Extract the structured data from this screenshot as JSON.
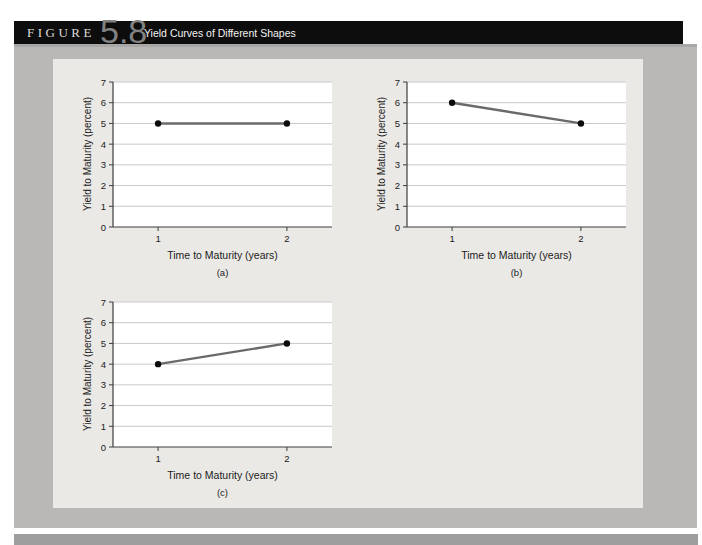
{
  "header": {
    "figure_label": "FIGURE",
    "figure_number": "5.8",
    "figure_title": "Yield Curves of Different Shapes"
  },
  "colors": {
    "header_bar": "#0d0d0d",
    "outer_panel": "#b9b8b6",
    "inner_panel": "#eae9e5",
    "plot_bg": "#ffffff",
    "gridline": "#c9c9c9",
    "axis": "#3c3c3c",
    "line": "#6a6a6a",
    "point": "#0c0c0c",
    "tick_text": "#1c1c1c",
    "bottom_bar": "#9e9e9e"
  },
  "chart_data": [
    {
      "type": "line",
      "caption": "(a)",
      "x": [
        1,
        2
      ],
      "y": [
        5,
        5
      ],
      "xlabel": "Time to Maturity (years)",
      "ylabel": "Yield to Maturity (percent)",
      "xticks": [
        1,
        2
      ],
      "yticks": [
        0,
        1,
        2,
        3,
        4,
        5,
        6,
        7
      ],
      "xlim": [
        0.65,
        2.35
      ],
      "ylim": [
        0,
        7
      ],
      "grid": "horizontal",
      "legend": "none"
    },
    {
      "type": "line",
      "caption": "(b)",
      "x": [
        1,
        2
      ],
      "y": [
        6,
        5
      ],
      "xlabel": "Time to Maturity (years)",
      "ylabel": "Yield to Maturity (percent)",
      "xticks": [
        1,
        2
      ],
      "yticks": [
        0,
        1,
        2,
        3,
        4,
        5,
        6,
        7
      ],
      "xlim": [
        0.65,
        2.35
      ],
      "ylim": [
        0,
        7
      ],
      "grid": "horizontal",
      "legend": "none"
    },
    {
      "type": "line",
      "caption": "(c)",
      "x": [
        1,
        2
      ],
      "y": [
        4,
        5
      ],
      "xlabel": "Time to Maturity (years)",
      "ylabel": "Yield to Maturity (percent)",
      "xticks": [
        1,
        2
      ],
      "yticks": [
        0,
        1,
        2,
        3,
        4,
        5,
        6,
        7
      ],
      "xlim": [
        0.65,
        2.35
      ],
      "ylim": [
        0,
        7
      ],
      "grid": "horizontal",
      "legend": "none"
    }
  ]
}
